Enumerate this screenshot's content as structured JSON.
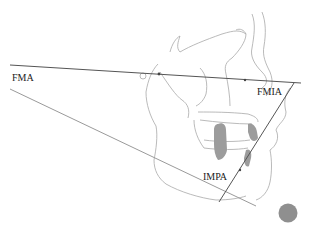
{
  "diagram": {
    "labels": {
      "fma": "FMA",
      "fmia": "FMIA",
      "impa": "IMPA"
    },
    "colors": {
      "reference_line": "#555555",
      "mandibular_line": "#9a9a9a",
      "tracing": "#a8a8a8",
      "teeth": "#9c9c9c",
      "marker": "#8f8f8f"
    }
  }
}
